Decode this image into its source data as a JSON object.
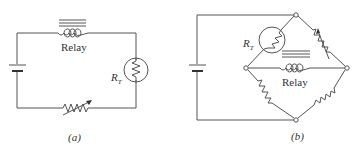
{
  "figure": {
    "panels": [
      {
        "id": "a",
        "caption": "(a)",
        "components": {
          "relay_label": "Relay",
          "thermistor_label": "R",
          "thermistor_subscript": "T",
          "battery": "battery",
          "variable_resistor": "variable-resistor"
        },
        "topology": "series loop: battery - relay - thermistor - variable resistor"
      },
      {
        "id": "b",
        "caption": "(b)",
        "components": {
          "relay_label": "Relay",
          "thermistor_label": "R",
          "thermistor_subscript": "T",
          "battery": "battery",
          "variable_resistor": "variable-resistor",
          "fixed_resistors": 2
        },
        "topology": "bridge: thermistor (upper-left arm), variable resistor (upper-right arm), two fixed resistors (lower arms), relay across left-right nodes, battery across top-bottom nodes"
      }
    ],
    "colors": {
      "line": "#555555",
      "text": "#333333",
      "background": "#ffffff"
    }
  }
}
